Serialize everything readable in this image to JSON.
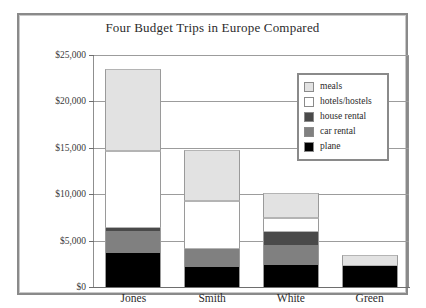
{
  "chart_data": {
    "type": "bar",
    "subtype": "stacked-bar",
    "title": "Four Budget Trips in Europe Compared",
    "xlabel": "",
    "ylabel": "",
    "ylim": [
      0,
      25000
    ],
    "ytick_values": [
      0,
      5000,
      10000,
      15000,
      20000,
      25000
    ],
    "ytick_labels": [
      "$0",
      "$5,000",
      "$10,000",
      "$15,000",
      "$20,000",
      "$25,000"
    ],
    "grid": true,
    "legend_position": "upper right",
    "categories": [
      "Jones",
      "Smith",
      "White",
      "Green"
    ],
    "series": [
      {
        "name": "plane",
        "color": "#000000",
        "values": [
          3700,
          2200,
          2350,
          2250
        ]
      },
      {
        "name": "car rental",
        "color": "#808080",
        "values": [
          2300,
          1900,
          2150,
          0
        ]
      },
      {
        "name": "house rental",
        "color": "#4a4a4a",
        "values": [
          400,
          0,
          1400,
          0
        ]
      },
      {
        "name": "hotels/hostels",
        "color": "#ffffff",
        "values": [
          8300,
          5200,
          1500,
          0
        ]
      },
      {
        "name": "meals",
        "color": "#e2e2e2",
        "values": [
          8800,
          5500,
          2700,
          1150
        ]
      }
    ],
    "totals": [
      23500,
      14800,
      10100,
      3400
    ]
  },
  "legend": {
    "entries": [
      {
        "label": "meals",
        "color": "#e2e2e2"
      },
      {
        "label": "hotels/hostels",
        "color": "#ffffff"
      },
      {
        "label": "house rental",
        "color": "#4a4a4a"
      },
      {
        "label": "car rental",
        "color": "#808080"
      },
      {
        "label": "plane",
        "color": "#000000"
      }
    ]
  }
}
